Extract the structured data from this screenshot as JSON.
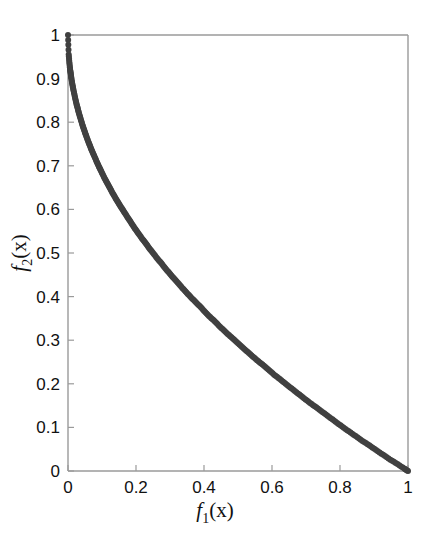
{
  "figure": {
    "background_color": "#ffffff",
    "axis_color": "#999999",
    "marker_color": "#404040",
    "text_color": "#111111"
  },
  "chart_data": {
    "type": "scatter",
    "title": "",
    "subtitle": "",
    "xlabel": "f_1(x)",
    "ylabel": "f_2(x)",
    "xlabel_base": "f",
    "xlabel_sub": "1",
    "xlabel_arg": "(x)",
    "ylabel_base": "f",
    "ylabel_sub": "2",
    "ylabel_arg": "(x)",
    "xlim": [
      0,
      1
    ],
    "ylim": [
      0,
      1
    ],
    "grid": false,
    "legend": null,
    "legend_position": "none",
    "annotations": [],
    "marker_style": "filled-circle",
    "marker_size": 3,
    "series": [
      {
        "name": "Pareto front",
        "relation": "f2 = 1 - sqrt(f1)",
        "x": [
          0.0,
          0.002,
          0.004,
          0.006,
          0.008,
          0.01,
          0.013,
          0.016,
          0.02,
          0.024,
          0.028,
          0.032,
          0.037,
          0.042,
          0.047,
          0.052,
          0.058,
          0.064,
          0.07,
          0.077,
          0.084,
          0.091,
          0.098,
          0.106,
          0.114,
          0.122,
          0.13,
          0.139,
          0.148,
          0.157,
          0.166,
          0.176,
          0.186,
          0.196,
          0.206,
          0.217,
          0.228,
          0.239,
          0.25,
          0.262,
          0.274,
          0.286,
          0.298,
          0.31,
          0.323,
          0.336,
          0.349,
          0.362,
          0.376,
          0.39,
          0.404,
          0.418,
          0.432,
          0.447,
          0.462,
          0.477,
          0.492,
          0.508,
          0.524,
          0.54,
          0.556,
          0.572,
          0.589,
          0.606,
          0.623,
          0.64,
          0.658,
          0.676,
          0.694,
          0.712,
          0.73,
          0.749,
          0.768,
          0.787,
          0.806,
          0.826,
          0.846,
          0.866,
          0.886,
          0.906,
          0.927,
          0.948,
          0.969,
          0.99,
          1.0
        ],
        "y": [
          1.0,
          0.955,
          0.937,
          0.922,
          0.911,
          0.9,
          0.886,
          0.874,
          0.859,
          0.845,
          0.833,
          0.821,
          0.808,
          0.795,
          0.783,
          0.772,
          0.759,
          0.747,
          0.735,
          0.723,
          0.71,
          0.698,
          0.687,
          0.674,
          0.662,
          0.651,
          0.639,
          0.627,
          0.615,
          0.604,
          0.593,
          0.581,
          0.569,
          0.557,
          0.546,
          0.534,
          0.523,
          0.511,
          0.5,
          0.488,
          0.477,
          0.465,
          0.454,
          0.443,
          0.432,
          0.42,
          0.409,
          0.398,
          0.387,
          0.376,
          0.364,
          0.353,
          0.343,
          0.331,
          0.32,
          0.309,
          0.299,
          0.287,
          0.276,
          0.265,
          0.254,
          0.244,
          0.233,
          0.221,
          0.211,
          0.2,
          0.189,
          0.178,
          0.167,
          0.156,
          0.146,
          0.135,
          0.124,
          0.113,
          0.102,
          0.091,
          0.08,
          0.069,
          0.059,
          0.048,
          0.037,
          0.026,
          0.016,
          0.005,
          0.0
        ]
      }
    ],
    "xticks": [
      0,
      0.2,
      0.4,
      0.6,
      0.8,
      1
    ],
    "xticklabels": [
      "0",
      "0.2",
      "0.4",
      "0.6",
      "0.8",
      "1"
    ],
    "yticks": [
      0,
      0.1,
      0.2,
      0.3,
      0.4,
      0.5,
      0.6,
      0.7,
      0.8,
      0.9,
      1
    ],
    "yticklabels": [
      "0",
      "0.1",
      "0.2",
      "0.3",
      "0.4",
      "0.5",
      "0.6",
      "0.7",
      "0.8",
      "0.9",
      "1"
    ]
  }
}
